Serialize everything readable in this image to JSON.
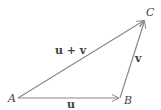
{
  "diagram": {
    "points": {
      "A": {
        "label": "A",
        "x": 18,
        "y": 98
      },
      "B": {
        "label": "B",
        "x": 120,
        "y": 98
      },
      "C": {
        "label": "C",
        "x": 145,
        "y": 20
      }
    },
    "vectors": [
      {
        "from": "A",
        "to": "B",
        "label": "u"
      },
      {
        "from": "B",
        "to": "C",
        "label": "v"
      },
      {
        "from": "A",
        "to": "C",
        "label": "u + v"
      }
    ],
    "colors": {
      "line": "#8a8a8a",
      "text": "#444444"
    }
  }
}
